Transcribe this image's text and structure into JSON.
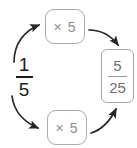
{
  "diagram": {
    "background_color": "#ffffff",
    "source_fraction": {
      "numerator": "1",
      "denominator": "5",
      "color": "#1c1c1c"
    },
    "result_fraction": {
      "numerator": "5",
      "denominator": "25",
      "color": "#6f6f6f"
    },
    "operators": {
      "top_label": "× 5",
      "bottom_label": "× 5",
      "color": "#8d8d8d",
      "border_color": "#a9a9a9"
    },
    "arrows": {
      "color": "#262626",
      "top_left": "curved arrow from source fraction up to top multiplier box",
      "top_right": "curved arrow from top multiplier box down to result fraction",
      "bottom_left": "curved arrow from source fraction down to bottom multiplier box",
      "bottom_right": "curved arrow from bottom multiplier box up to result fraction"
    }
  }
}
